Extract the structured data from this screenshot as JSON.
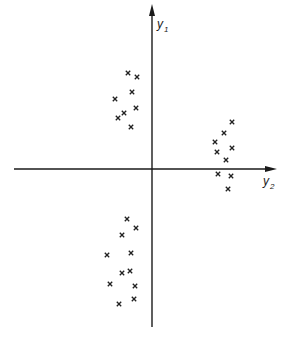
{
  "diagram": {
    "axes": {
      "vertical": {
        "label": "y",
        "subscript": "1",
        "x": 152,
        "y_top": 10,
        "y_bottom": 327
      },
      "horizontal": {
        "label": "y",
        "subscript": "2",
        "y": 169,
        "x_left": 14,
        "x_right": 276
      }
    },
    "marker": "x",
    "color": "#222222"
  },
  "chart_data": {
    "type": "scatter",
    "title": "",
    "xlabel": "y2",
    "ylabel": "y1",
    "grid": false,
    "legend": null,
    "note": "Coordinates are in pixel space of the figure (origin at axis crossing: x=152, y=169). Three clusters of points.",
    "series": [
      {
        "name": "cluster-upper-left",
        "points": [
          {
            "x": 128,
            "y": 73
          },
          {
            "x": 137,
            "y": 77
          },
          {
            "x": 132,
            "y": 92
          },
          {
            "x": 115,
            "y": 99
          },
          {
            "x": 136,
            "y": 108
          },
          {
            "x": 124,
            "y": 113
          },
          {
            "x": 118,
            "y": 118
          },
          {
            "x": 131,
            "y": 127
          }
        ]
      },
      {
        "name": "cluster-right",
        "points": [
          {
            "x": 232,
            "y": 122
          },
          {
            "x": 224,
            "y": 133
          },
          {
            "x": 215,
            "y": 142
          },
          {
            "x": 232,
            "y": 148
          },
          {
            "x": 217,
            "y": 152
          },
          {
            "x": 226,
            "y": 160
          },
          {
            "x": 218,
            "y": 174
          },
          {
            "x": 231,
            "y": 176
          },
          {
            "x": 228,
            "y": 189
          }
        ]
      },
      {
        "name": "cluster-lower",
        "points": [
          {
            "x": 127,
            "y": 219
          },
          {
            "x": 136,
            "y": 228
          },
          {
            "x": 122,
            "y": 235
          },
          {
            "x": 107,
            "y": 255
          },
          {
            "x": 131,
            "y": 253
          },
          {
            "x": 122,
            "y": 273
          },
          {
            "x": 130,
            "y": 271
          },
          {
            "x": 110,
            "y": 284
          },
          {
            "x": 135,
            "y": 286
          },
          {
            "x": 134,
            "y": 299
          },
          {
            "x": 119,
            "y": 304
          }
        ]
      }
    ]
  }
}
